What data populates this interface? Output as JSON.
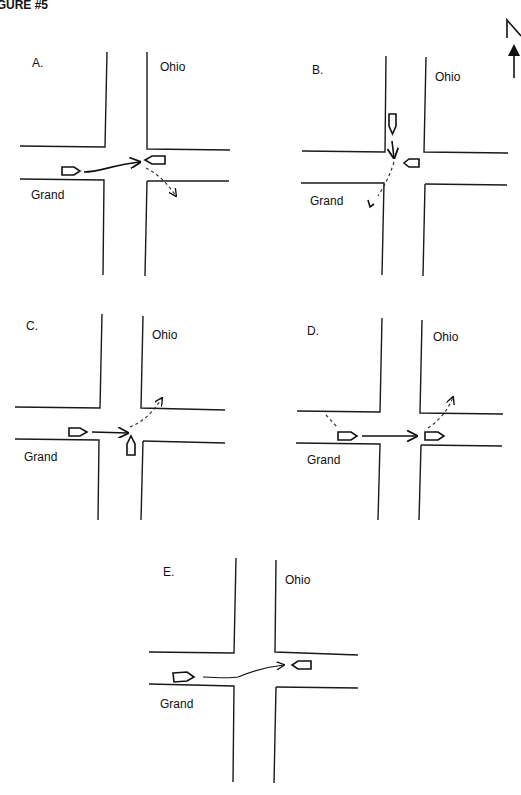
{
  "figure_title": "FIGURE #5",
  "north_arrow": {
    "label": "N"
  },
  "panels": [
    {
      "id": "A",
      "label": "A.",
      "north_street": "Ohio",
      "west_street": "Grand"
    },
    {
      "id": "B",
      "label": "B.",
      "north_street": "Ohio",
      "west_street": "Grand"
    },
    {
      "id": "C",
      "label": "C.",
      "north_street": "Ohio",
      "west_street": "Grand"
    },
    {
      "id": "D",
      "label": "D.",
      "north_street": "Ohio",
      "west_street": "Grand"
    },
    {
      "id": "E",
      "label": "E.",
      "north_street": "Ohio",
      "west_street": "Grand"
    }
  ]
}
